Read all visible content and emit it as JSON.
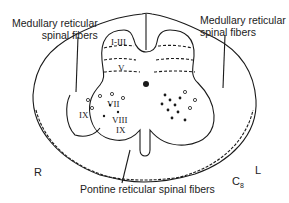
{
  "diagram": {
    "type": "spinal-cord-cross-section",
    "labels": {
      "top_left": [
        "Medullary reticular",
        "spinal fibers"
      ],
      "top_right": [
        "Medullary reticular",
        "spinal  fibers"
      ],
      "bottom": "Pontine reticular spinal fibers"
    },
    "sides": {
      "right": "R",
      "left": "L"
    },
    "segment": {
      "letter": "C",
      "number": "8"
    },
    "laminae": {
      "l1_3": "I-III",
      "l5": "V",
      "l7": "VII",
      "l8": "VIII",
      "l9_right": "IX",
      "l9_mid": "IX"
    },
    "colors": {
      "line": "#1a1a1a",
      "background": "#ffffff"
    }
  }
}
